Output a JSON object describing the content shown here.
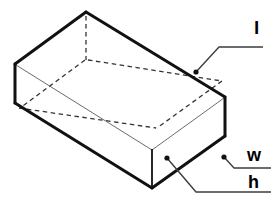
{
  "figure": {
    "shape_name": "open-top rectangular box",
    "projection": "isometric",
    "background_color": "#ffffff",
    "line_color": "#1a1a1a",
    "thin_line_color": "#555555",
    "hidden_line_style": "dashed"
  },
  "labels": {
    "length": {
      "text": "l",
      "meaning": "length",
      "anchor_x": 196,
      "anchor_y": 72,
      "elbow_x": 219,
      "elbow_y": 47,
      "end_x": 263,
      "end_y": 47
    },
    "width": {
      "text": "w",
      "meaning": "width",
      "anchor_x": 224,
      "anchor_y": 157,
      "elbow_x": 234,
      "elbow_y": 168,
      "end_x": 271,
      "end_y": 168
    },
    "height": {
      "text": "h",
      "meaning": "height",
      "anchor_x": 167,
      "anchor_y": 158,
      "elbow_x": 196,
      "elbow_y": 192,
      "end_x": 271,
      "end_y": 192
    }
  },
  "geometry": {
    "vertices": {
      "top_back": [
        86,
        12
      ],
      "top_left": [
        15,
        64
      ],
      "top_right": [
        225,
        97
      ],
      "top_front": [
        152,
        149
      ],
      "bottom_left": [
        15,
        103
      ],
      "bottom_front": [
        152,
        188
      ],
      "bottom_right": [
        225,
        136
      ],
      "inner_back": [
        86,
        58
      ],
      "inner_left": [
        18,
        69
      ],
      "inner_right": [
        219,
        100
      ],
      "inner_front": [
        152,
        144
      ]
    },
    "solid_edges": [
      "top_back-top_left",
      "top_back-top_right",
      "top_left-bottom_left",
      "bottom_left-bottom_front",
      "bottom_front-bottom_right",
      "bottom_right-top_right",
      "top_front-bottom_front"
    ],
    "thin_edges": [
      "top_left-top_front",
      "top_front-top_right"
    ],
    "dashed_edges": [
      "top_back-inner_back",
      "inner_back-inner_left",
      "inner_back-inner_right",
      "inner_left-inner_front",
      "inner_right-inner_front"
    ]
  }
}
